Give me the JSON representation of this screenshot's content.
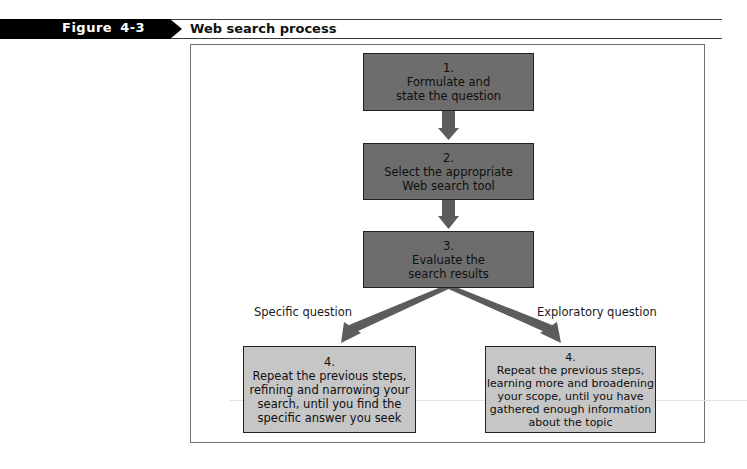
{
  "header": {
    "figure_label": "Figure  4-3",
    "title": "Web search process"
  },
  "diagram": {
    "steps": [
      {
        "number": "1.",
        "lines": [
          "Formulate and",
          "state the question"
        ]
      },
      {
        "number": "2.",
        "lines": [
          "Select the appropriate",
          "Web search tool"
        ]
      },
      {
        "number": "3.",
        "lines": [
          "Evaluate the",
          "search results"
        ]
      }
    ],
    "branches": [
      {
        "label": "Specific question",
        "number": "4.",
        "lines": [
          "Repeat the previous steps,",
          "refining and narrowing your",
          "search, until you find the",
          "specific answer you seek"
        ]
      },
      {
        "label": "Exploratory question",
        "number": "4.",
        "lines": [
          "Repeat the previous steps,",
          "learning more and broadening",
          "your scope, until you have",
          "gathered enough information",
          "about the topic"
        ]
      }
    ],
    "colors": {
      "step_box": "#6d6d6d",
      "branch_box": "#c6c6c6",
      "arrow": "#5c5c5c",
      "banner": "#000000"
    }
  }
}
